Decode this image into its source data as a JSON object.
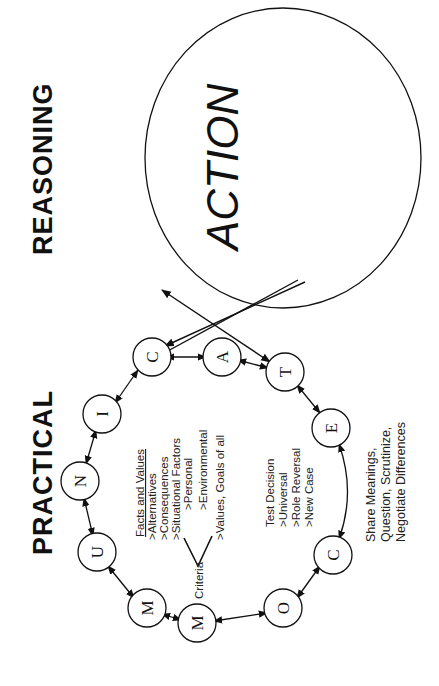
{
  "title": {
    "word1": "PRACTICAL",
    "word2": "REASONING"
  },
  "action": {
    "label": "ACTION"
  },
  "nodes": [
    {
      "letter": "C",
      "x": 152,
      "y": 357
    },
    {
      "letter": "O",
      "x": 283,
      "y": 608
    },
    {
      "letter": "M",
      "x": 197,
      "y": 623
    },
    {
      "letter": "M",
      "x": 147,
      "y": 608
    },
    {
      "letter": "U",
      "x": 97,
      "y": 552
    },
    {
      "letter": "N",
      "x": 80,
      "y": 481
    },
    {
      "letter": "I",
      "x": 102,
      "y": 414
    },
    {
      "letter": "C",
      "x": 152,
      "y": 357
    },
    {
      "letter": "A",
      "x": 222,
      "y": 357
    },
    {
      "letter": "T",
      "x": 285,
      "y": 372
    },
    {
      "letter": "E",
      "x": 331,
      "y": 428
    },
    {
      "letter": "C",
      "x": 333,
      "y": 555
    }
  ],
  "facts_and_values": {
    "heading": "Facts and Values",
    "items": [
      ">Alternatives",
      ">Consequences",
      ">Situational Factors"
    ],
    "sub_items": [
      ">Personal",
      ">Environmental"
    ],
    "values": ">Values, Goals of all",
    "criteria_label": "Criteria"
  },
  "test_decision": {
    "heading": "Test Decision",
    "items": [
      ">Universal",
      ">Role Reversal",
      ">New Case"
    ]
  },
  "share_note": {
    "lines": [
      "Share Meanings,",
      "Question, Scrutinize,",
      "Negotiate Differences"
    ]
  },
  "colors": {
    "ink": "#111111",
    "background": "#ffffff"
  }
}
